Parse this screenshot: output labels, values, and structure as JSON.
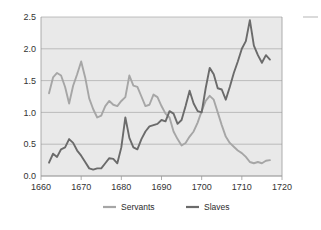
{
  "chart_data": {
    "type": "line",
    "title": "",
    "subtitle": "",
    "xlabel": "",
    "ylabel": "",
    "xlim": [
      1660,
      1720
    ],
    "ylim": [
      0.0,
      2.5
    ],
    "xticks": [
      1660,
      1670,
      1680,
      1690,
      1700,
      1710,
      1720
    ],
    "xtick_labels": [
      "1660",
      "1670",
      "1680",
      "1690",
      "1700",
      "1710",
      "1720"
    ],
    "yticks": [
      0.0,
      0.5,
      1.0,
      1.5,
      2.0,
      2.5
    ],
    "ytick_labels": [
      "0.0",
      "0.5",
      "1.0",
      "1.5",
      "2.0",
      "2.5"
    ],
    "grid": "horizontal",
    "legend_position": "bottom",
    "plot_background": "#e9e9e9",
    "series": [
      {
        "name": "Servants",
        "color": "#a6a6a6",
        "x": [
          1662,
          1663,
          1664,
          1665,
          1666,
          1667,
          1668,
          1669,
          1670,
          1671,
          1672,
          1673,
          1674,
          1675,
          1676,
          1677,
          1678,
          1679,
          1680,
          1681,
          1682,
          1683,
          1684,
          1685,
          1686,
          1687,
          1688,
          1689,
          1690,
          1691,
          1692,
          1693,
          1694,
          1695,
          1696,
          1697,
          1698,
          1699,
          1700,
          1701,
          1702,
          1703,
          1704,
          1705,
          1706,
          1707,
          1708,
          1709,
          1710,
          1711,
          1712,
          1713,
          1714,
          1715,
          1716,
          1717
        ],
        "values": [
          1.3,
          1.55,
          1.62,
          1.58,
          1.4,
          1.14,
          1.42,
          1.6,
          1.8,
          1.55,
          1.22,
          1.05,
          0.92,
          0.95,
          1.1,
          1.18,
          1.12,
          1.1,
          1.18,
          1.24,
          1.58,
          1.42,
          1.4,
          1.25,
          1.1,
          1.12,
          1.28,
          1.24,
          1.1,
          0.98,
          0.92,
          0.7,
          0.58,
          0.48,
          0.52,
          0.62,
          0.7,
          0.84,
          1.02,
          1.18,
          1.26,
          1.2,
          1.0,
          0.8,
          0.62,
          0.52,
          0.46,
          0.4,
          0.36,
          0.3,
          0.22,
          0.2,
          0.22,
          0.2,
          0.24,
          0.25
        ]
      },
      {
        "name": "Slaves",
        "color": "#6b6b6b",
        "x": [
          1662,
          1663,
          1664,
          1665,
          1666,
          1667,
          1668,
          1669,
          1670,
          1671,
          1672,
          1673,
          1674,
          1675,
          1676,
          1677,
          1678,
          1679,
          1680,
          1681,
          1682,
          1683,
          1684,
          1685,
          1686,
          1687,
          1688,
          1689,
          1690,
          1691,
          1692,
          1693,
          1694,
          1695,
          1696,
          1697,
          1698,
          1699,
          1700,
          1701,
          1702,
          1703,
          1704,
          1705,
          1706,
          1707,
          1708,
          1709,
          1710,
          1711,
          1712,
          1713,
          1714,
          1715,
          1716,
          1717
        ],
        "values": [
          0.21,
          0.35,
          0.3,
          0.42,
          0.45,
          0.58,
          0.52,
          0.4,
          0.32,
          0.22,
          0.12,
          0.1,
          0.12,
          0.12,
          0.2,
          0.28,
          0.27,
          0.2,
          0.45,
          0.92,
          0.6,
          0.45,
          0.42,
          0.58,
          0.7,
          0.78,
          0.8,
          0.82,
          0.88,
          0.86,
          1.02,
          0.98,
          0.82,
          0.88,
          1.1,
          1.34,
          1.14,
          1.02,
          1.0,
          1.38,
          1.7,
          1.6,
          1.38,
          1.36,
          1.2,
          1.4,
          1.62,
          1.8,
          2.0,
          2.12,
          2.45,
          2.05,
          1.9,
          1.78,
          1.9,
          1.83
        ]
      }
    ]
  },
  "legend": {
    "items": [
      {
        "label": "Servants",
        "color": "#a6a6a6"
      },
      {
        "label": "Slaves",
        "color": "#6b6b6b"
      }
    ]
  }
}
